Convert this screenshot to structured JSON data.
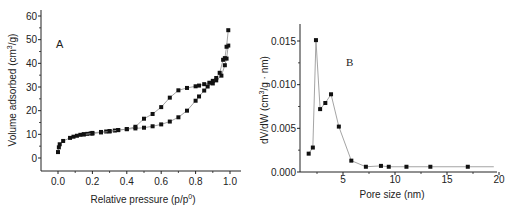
{
  "chart_data": [
    {
      "type": "scatter",
      "panel_label": "A",
      "title": "",
      "xlabel": "Relative pressure (p/p⁰)",
      "xlabel_main": "Relative pressure (p/p",
      "xlabel_sup": "0",
      "xlabel_end": ")",
      "ylabel": "Volume adsorbed (cm³/g)",
      "ylabel_main": "Volume adsorbed (cm",
      "ylabel_sup": "3",
      "ylabel_end": "/g)",
      "xlim": [
        -0.1,
        1.05
      ],
      "ylim": [
        -6,
        60
      ],
      "x_ticks": [
        "0.0",
        "0.2",
        "0.4",
        "0.6",
        "0.8",
        "1.0"
      ],
      "x_tick_values": [
        0.0,
        0.2,
        0.4,
        0.6,
        0.8,
        1.0
      ],
      "y_ticks": [
        "0",
        "10",
        "20",
        "30",
        "40",
        "50",
        "60"
      ],
      "y_tick_values": [
        0,
        10,
        20,
        30,
        40,
        50,
        60
      ],
      "grid": false,
      "legend": null,
      "series": [
        {
          "name": "Adsorption",
          "x": [
            0.0,
            0.005,
            0.01,
            0.03,
            0.07,
            0.09,
            0.11,
            0.13,
            0.15,
            0.17,
            0.19,
            0.2,
            0.25,
            0.28,
            0.3,
            0.33,
            0.35,
            0.4,
            0.45,
            0.5,
            0.55,
            0.6,
            0.65,
            0.7,
            0.75,
            0.8,
            0.82,
            0.85,
            0.87,
            0.9,
            0.92,
            0.95,
            0.97,
            0.98,
            0.99
          ],
          "y": [
            2.5,
            4.5,
            5.8,
            7.2,
            8.5,
            9.0,
            9.4,
            9.8,
            10.0,
            10.2,
            10.4,
            10.6,
            11.0,
            11.2,
            11.4,
            11.6,
            11.8,
            12.2,
            12.5,
            12.8,
            13.4,
            14.2,
            15.4,
            17.2,
            20.0,
            24.2,
            26.0,
            28.5,
            30.2,
            31.5,
            32.8,
            34.8,
            39.2,
            42.0,
            47.5
          ]
        },
        {
          "name": "Desorption",
          "x": [
            0.99,
            0.98,
            0.97,
            0.96,
            0.94,
            0.92,
            0.9,
            0.88,
            0.85,
            0.82,
            0.8,
            0.75,
            0.7,
            0.65,
            0.6,
            0.55,
            0.5,
            0.45,
            0.4,
            0.35,
            0.3,
            0.25,
            0.2,
            0.15
          ],
          "y": [
            54.0,
            47.0,
            42.2,
            41.5,
            36.0,
            33.8,
            32.6,
            31.8,
            31.2,
            30.6,
            30.3,
            29.6,
            28.6,
            25.5,
            21.5,
            18.6,
            16.6,
            13.2,
            12.2,
            11.8,
            11.2,
            10.8,
            10.3,
            10.0
          ]
        }
      ]
    },
    {
      "type": "line",
      "panel_label": "B",
      "title": "",
      "xlabel": "Pore size (nm)",
      "ylabel": "dV/dW (cm³/g · nm)",
      "ylabel_main": "dV/dW (cm",
      "ylabel_sup": "3",
      "ylabel_end": "/g · nm)",
      "xlim": [
        0.9,
        20
      ],
      "ylim": [
        0,
        0.0165
      ],
      "x_ticks": [
        "5",
        "10",
        "15",
        "20"
      ],
      "x_tick_values": [
        5,
        10,
        15,
        20
      ],
      "y_ticks": [
        "0.000",
        "0.005",
        "0.010",
        "0.015"
      ],
      "y_tick_values": [
        0.0,
        0.005,
        0.01,
        0.015
      ],
      "grid": false,
      "legend": null,
      "series": [
        {
          "name": "Pore size distribution",
          "x": [
            1.7,
            2.1,
            2.4,
            2.8,
            3.3,
            3.85,
            4.6,
            5.8,
            7.2,
            8.65,
            9.4,
            11.1,
            13.4,
            17.0,
            19.5
          ],
          "y": [
            0.0021,
            0.0028,
            0.0151,
            0.0072,
            0.0079,
            0.0089,
            0.0052,
            0.0013,
            0.0006,
            0.0007,
            0.0006,
            0.0006,
            0.0006,
            0.0006,
            0.0006
          ],
          "markers_shown": [
            true,
            true,
            true,
            true,
            true,
            true,
            true,
            true,
            true,
            true,
            true,
            true,
            true,
            true,
            false
          ]
        }
      ]
    }
  ],
  "colors": {
    "axis": "#222222",
    "marker": "#111111",
    "line": "#9a9a9a",
    "background": "#ffffff"
  }
}
